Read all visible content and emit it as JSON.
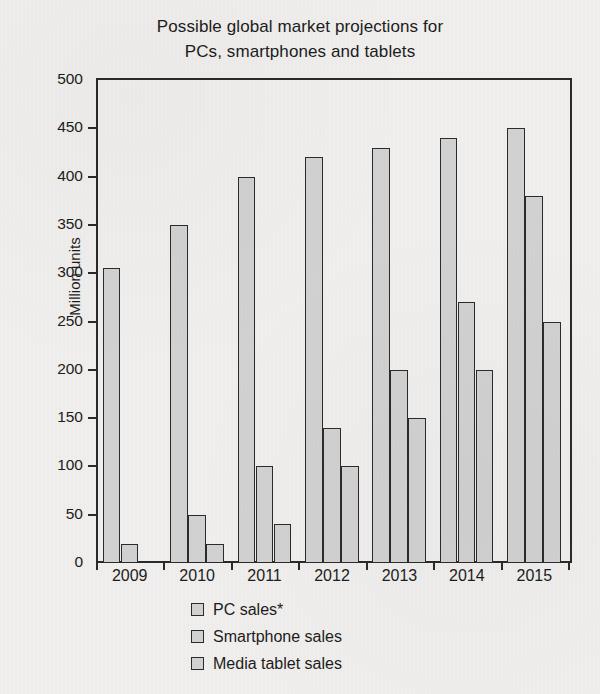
{
  "chart_data": {
    "type": "bar",
    "title": "Possible global market projections for PCs, smartphones and tablets",
    "title_lines": [
      "Possible global market projections for",
      "PCs, smartphones and tablets"
    ],
    "xlabel": "",
    "ylabel": "Million units",
    "categories": [
      "2009",
      "2010",
      "2011",
      "2012",
      "2013",
      "2014",
      "2015"
    ],
    "ylim": [
      0,
      500
    ],
    "yticks": [
      0,
      50,
      100,
      150,
      200,
      250,
      300,
      350,
      400,
      450,
      500
    ],
    "grid": false,
    "legend_position": "bottom",
    "series": [
      {
        "name": "PC sales*",
        "color": "#d2d2d2",
        "values": [
          305,
          350,
          400,
          420,
          430,
          440,
          450
        ]
      },
      {
        "name": "Smartphone sales",
        "color": "#d2d2d2",
        "values": [
          20,
          50,
          100,
          140,
          200,
          270,
          380
        ]
      },
      {
        "name": "Media tablet sales",
        "color": "#d2d2d2",
        "values": [
          0,
          20,
          40,
          100,
          150,
          200,
          250
        ]
      }
    ]
  },
  "style": {
    "background": "#f0efed",
    "axis_color": "#2a2a2a",
    "bar_fill": "#d2d2d2",
    "bar_edge": "#2b2b2b",
    "text_color": "#1c1c1c"
  }
}
